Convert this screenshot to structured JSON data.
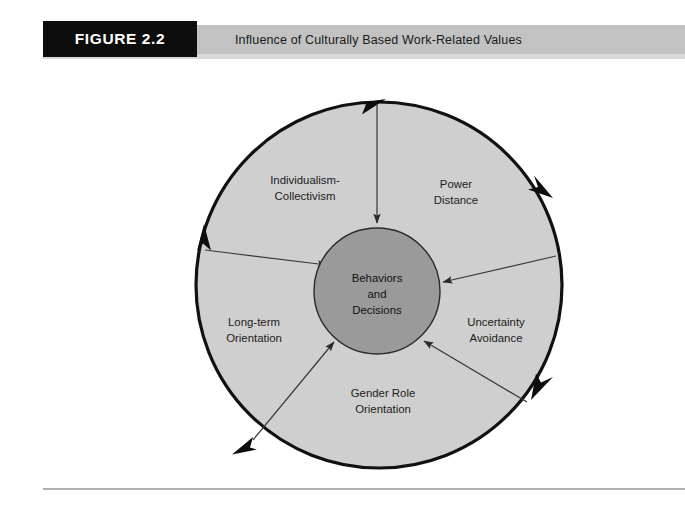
{
  "header": {
    "figure_tag": "FIGURE 2.2",
    "title": "Influence of Culturally Based Work-Related Values",
    "tag_bg_color": "#0d0d0d",
    "band_color": "#c2c2c2"
  },
  "diagram": {
    "type": "radial-cycle",
    "core": {
      "lines": [
        "Behaviors",
        "and",
        "Decisions"
      ],
      "fill_color": "#9a9a9a",
      "center_x": 377,
      "center_y": 231,
      "radius": 63
    },
    "outer_ring": {
      "fill_color": "#cfcfcf",
      "stroke_color": "#111111",
      "center_x": 379,
      "center_y": 225,
      "radius": 183,
      "direction": "clockwise",
      "arrowhead_count": 5
    },
    "segments": [
      {
        "id": "individualism-collectivism",
        "lines": [
          "Individualism-",
          "Collectivism"
        ],
        "label_x": 305,
        "label_y": 124
      },
      {
        "id": "power-distance",
        "lines": [
          "Power",
          "Distance"
        ],
        "label_x": 456,
        "label_y": 128
      },
      {
        "id": "uncertainty-avoidance",
        "lines": [
          "Uncertainty",
          "Avoidance"
        ],
        "label_x": 496,
        "label_y": 266
      },
      {
        "id": "gender-role-orientation",
        "lines": [
          "Gender Role",
          "Orientation"
        ],
        "label_x": 383,
        "label_y": 337
      },
      {
        "id": "long-term-orientation",
        "lines": [
          "Long-term",
          "Orientation"
        ],
        "label_x": 254,
        "label_y": 266
      }
    ]
  }
}
